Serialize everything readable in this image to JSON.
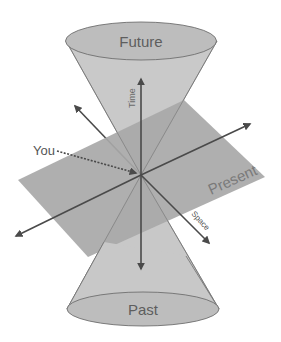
{
  "diagram": {
    "title_top_cone": "Future",
    "title_bottom_cone": "Past",
    "plane_label": "Present",
    "time_axis_label": "Time",
    "space_axis_left_label": "Space",
    "space_axis_right_label": "Space",
    "observer_label": "You"
  },
  "colors": {
    "background": "#ffffff",
    "cone_fill": "#c8c8c8",
    "cone_cap_fill": "#bdbdbd",
    "plane_fill": "#a9a9a9",
    "axis_stroke": "#4a4a4a",
    "text": "#6a6a6a"
  }
}
